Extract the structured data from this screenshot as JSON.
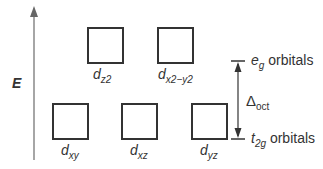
{
  "diagram": {
    "axis_label": "E",
    "eg_group": {
      "label_symbol": "e",
      "label_sub": "g",
      "label_text": "orbitals",
      "orbitals": [
        {
          "base": "d",
          "sub": "z2"
        },
        {
          "base": "d",
          "sub": "x2−y2"
        }
      ]
    },
    "t2g_group": {
      "label_symbol": "t",
      "label_sub": "2g",
      "label_text": "orbitals",
      "orbitals": [
        {
          "base": "d",
          "sub": "xy"
        },
        {
          "base": "d",
          "sub": "xz"
        },
        {
          "base": "d",
          "sub": "yz"
        }
      ]
    },
    "splitting": {
      "symbol": "Δ",
      "sub": "oct"
    },
    "colors": {
      "line": "#333333",
      "axis": "#888888"
    }
  }
}
